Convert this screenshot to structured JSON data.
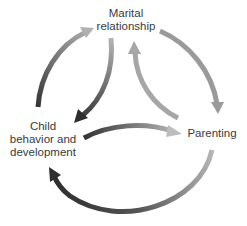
{
  "diagram": {
    "type": "cycle",
    "nodes": {
      "marital": {
        "label_line1": "Marital",
        "label_line2": "relationship"
      },
      "child": {
        "label_line1": "Child",
        "label_line2": "behavior and",
        "label_line3": "development"
      },
      "parenting": {
        "label": "Parenting"
      }
    },
    "edges": [
      {
        "from": "Child behavior and development",
        "to": "Marital relationship",
        "path": "outer-left"
      },
      {
        "from": "Marital relationship",
        "to": "Child behavior and development",
        "path": "inner-left"
      },
      {
        "from": "Marital relationship",
        "to": "Parenting",
        "path": "outer-right"
      },
      {
        "from": "Parenting",
        "to": "Marital relationship",
        "path": "inner-right"
      },
      {
        "from": "Child behavior and development",
        "to": "Parenting",
        "path": "middle"
      },
      {
        "from": "Parenting",
        "to": "Child behavior and development",
        "path": "outer-bottom"
      }
    ],
    "colors": {
      "dark": "#3a3a3a",
      "light": "#a8a8a8",
      "text": "#3a3a3a"
    }
  }
}
